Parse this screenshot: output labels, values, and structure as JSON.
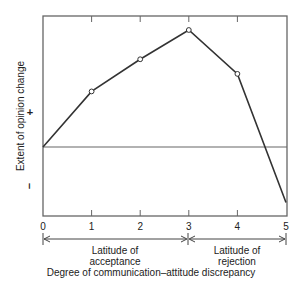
{
  "chart_data": {
    "type": "line",
    "title": "",
    "xlabel": "Degree of communication–attitude discrepancy",
    "ylabel": "Extent of opinion change",
    "x": [
      0,
      1,
      2,
      3,
      4,
      5
    ],
    "x_tick_labels": [
      "0",
      "1",
      "2",
      "3",
      "4",
      "5"
    ],
    "series": [
      {
        "name": "Opinion change",
        "values": [
          0,
          1.9,
          3.0,
          4.0,
          2.5,
          -1.9
        ],
        "markers": [
          false,
          true,
          true,
          true,
          true,
          false
        ]
      }
    ],
    "y_tick_labels": {
      "positive": "+",
      "negative": "–"
    },
    "xlim": [
      0,
      5
    ],
    "ylim": [
      -2.4,
      4.5
    ],
    "zero_line": true,
    "grid": false,
    "annotations": [
      {
        "range": [
          0,
          3
        ],
        "label_line1": "Latitude of",
        "label_line2": "acceptance"
      },
      {
        "range": [
          3,
          5
        ],
        "label_line1": "Latitude of",
        "label_line2": "rejection"
      }
    ]
  }
}
